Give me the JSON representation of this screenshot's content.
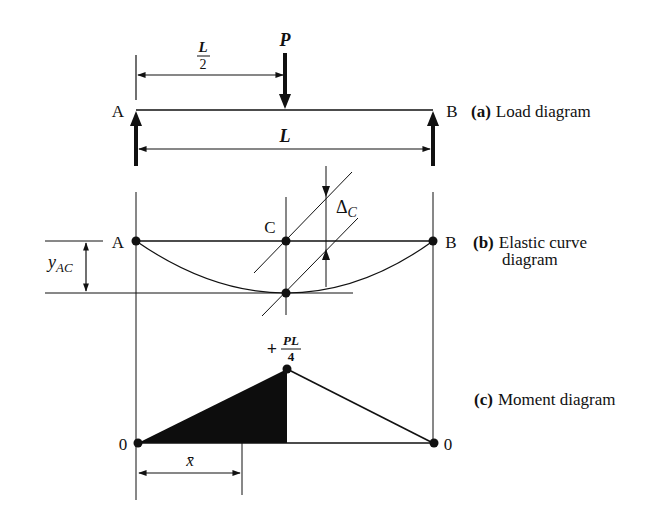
{
  "captions": {
    "a": {
      "tag": "(a)",
      "text": "Load diagram"
    },
    "b": {
      "tag": "(b)",
      "text_line1": "Elastic curve",
      "text_line2": "diagram"
    },
    "c": {
      "tag": "(c)",
      "text": "Moment diagram"
    }
  },
  "load_diagram": {
    "support_left": "A",
    "support_right": "B",
    "load_label": "P",
    "half_span_num": "L",
    "half_span_den": "2",
    "span_label": "L"
  },
  "elastic_curve": {
    "point_left": "A",
    "point_right": "B",
    "point_mid": "C",
    "deflection_label_main": "Δ",
    "deflection_label_sub": "C",
    "offset_label_main": "y",
    "offset_label_sub": "AC"
  },
  "moment_diagram": {
    "left_value": "0",
    "right_value": "0",
    "peak_sign": "+",
    "peak_num": "PL",
    "peak_den": "4",
    "centroid_label": "x̄"
  },
  "colors": {
    "ink": "#111111",
    "fill": "#0d0d0d",
    "background": "#ffffff"
  }
}
